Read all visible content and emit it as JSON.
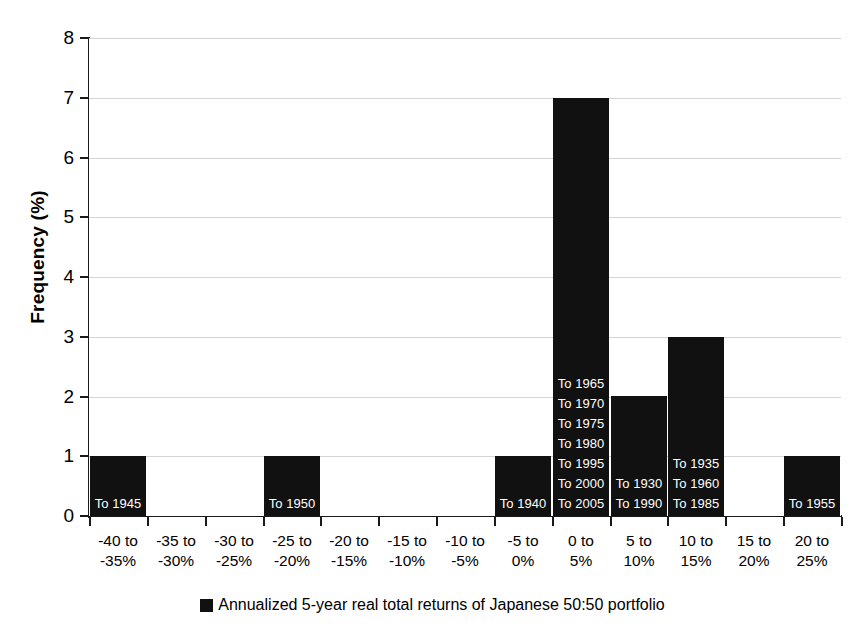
{
  "chart_data": {
    "type": "bar",
    "title": "",
    "subtitle": "",
    "xlabel": "",
    "ylabel": "Frequency (%)",
    "ylim": [
      0,
      8
    ],
    "ytick_values": [
      0,
      1,
      2,
      3,
      4,
      5,
      6,
      7,
      8
    ],
    "ytick_labels": [
      "0",
      "1",
      "2",
      "3",
      "4",
      "5",
      "6",
      "7",
      "8"
    ],
    "grid": "horizontal",
    "legend_position": "bottom-center",
    "legend": [
      "Annualized 5-year real total returns of Japanese 50:50 portfolio"
    ],
    "bar_color": "#111111",
    "categories": [
      "-40 to\n-35%",
      "-35 to\n-30%",
      "-30 to\n-25%",
      "-25 to\n-20%",
      "-20 to\n-15%",
      "-15 to\n-10%",
      "-10 to\n-5%",
      "-5 to\n0%",
      "0 to\n5%",
      "5 to\n10%",
      "10 to\n15%",
      "15 to\n20%",
      "20 to\n25%"
    ],
    "values": [
      1,
      0,
      0,
      1,
      0,
      0,
      0,
      1,
      7,
      2,
      3,
      0,
      1
    ],
    "point_labels": [
      [
        "To 1945"
      ],
      [],
      [],
      [
        "To 1950"
      ],
      [],
      [],
      [],
      [
        "To 1940"
      ],
      [
        "To 1965",
        "To 1970",
        "To 1975",
        "To 1980",
        "To 1995",
        "To 2000",
        "To 2005"
      ],
      [
        "To 1930",
        "To 1990"
      ],
      [
        "To 1935",
        "To 1960",
        "To 1985"
      ],
      [],
      [
        "To 1955"
      ]
    ]
  },
  "axis": {
    "y_title": "Frequency (%)"
  },
  "legend": {
    "label": "Annualized 5-year real total returns of Japanese 50:50 portfolio"
  },
  "colors": {
    "bar": "#111111",
    "grid": "#d5d5d5",
    "axis": "#1a1a1a",
    "background": "#ffffff",
    "bar_label_text": "#ffffff"
  }
}
